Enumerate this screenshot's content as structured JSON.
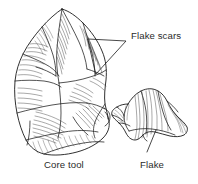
{
  "figure": {
    "background_color": "#ffffff",
    "ink_color": "#1a1a1a",
    "text_color": "#2b2b2b",
    "width": 198,
    "height": 184,
    "style": "pen-and-ink stipple/hatch line drawing"
  },
  "labels": {
    "flake_scars": "Flake scars",
    "core_tool": "Core tool",
    "flake": "Flake"
  },
  "callouts": [
    {
      "name": "flake-scars-callout",
      "label": "Flake scars",
      "text_x": 131,
      "text_y": 39,
      "leader_type": "forked-v",
      "vertex": [
        126,
        41
      ],
      "targets": [
        [
          88,
          39
        ],
        [
          96,
          74
        ]
      ]
    },
    {
      "name": "flake-callout",
      "label": "Flake",
      "text_x": 140,
      "text_y": 168,
      "leader_type": "straight",
      "from": [
        156,
        130
      ],
      "to": [
        147,
        152
      ]
    },
    {
      "name": "core-tool-caption",
      "label": "Core tool",
      "text_x": 44,
      "text_y": 168,
      "leader_type": "none"
    }
  ],
  "objects": [
    {
      "name": "core-tool",
      "label": "Core tool",
      "description": "Large bifacially flaked handaxe-like core, pointed at top, broad rounded base",
      "bbox": [
        14,
        8,
        115,
        156
      ]
    },
    {
      "name": "flake",
      "label": "Flake",
      "description": "Detached flake with bulb of percussion and concentric ripple marks",
      "bbox": [
        112,
        88,
        188,
        140
      ]
    }
  ]
}
